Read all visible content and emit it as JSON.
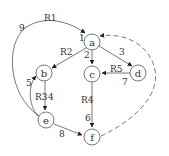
{
  "diagram": {
    "type": "directed-graph",
    "nodes": [
      {
        "id": "a",
        "label": "a",
        "x": 92,
        "y": 42
      },
      {
        "id": "b",
        "label": "b",
        "x": 44,
        "y": 73
      },
      {
        "id": "c",
        "label": "c",
        "x": 92,
        "y": 74
      },
      {
        "id": "d",
        "label": "d",
        "x": 138,
        "y": 73
      },
      {
        "id": "e",
        "label": "e",
        "x": 46,
        "y": 120
      },
      {
        "id": "f",
        "label": "f",
        "x": 92,
        "y": 137
      }
    ],
    "edges": [
      {
        "id": "e1",
        "from": "e",
        "to": "a",
        "num": "9",
        "name": "R1",
        "style": "solid"
      },
      {
        "id": "e2",
        "from": "a",
        "to": "b",
        "num": "1",
        "name": "R2",
        "style": "solid"
      },
      {
        "id": "e3",
        "from": "a",
        "to": "c",
        "num": "2",
        "name": "",
        "style": "solid"
      },
      {
        "id": "e4",
        "from": "a",
        "to": "d",
        "num": "3",
        "name": "",
        "style": "solid"
      },
      {
        "id": "e5",
        "from": "d",
        "to": "c",
        "num": "7",
        "name": "R5",
        "style": "solid"
      },
      {
        "id": "e6",
        "from": "b",
        "to": "e",
        "num": "4",
        "name": "R3",
        "style": "solid"
      },
      {
        "id": "e7",
        "from": "e",
        "to": "b",
        "num": "5",
        "name": "",
        "style": "solid"
      },
      {
        "id": "e8",
        "from": "c",
        "to": "f",
        "num": "6",
        "name": "R4",
        "style": "solid"
      },
      {
        "id": "e9",
        "from": "e",
        "to": "f",
        "num": "8",
        "name": "",
        "style": "solid"
      },
      {
        "id": "e10",
        "from": "f",
        "to": "a",
        "num": "",
        "name": "",
        "style": "dashed"
      }
    ],
    "labels": {
      "R1": "R1",
      "R2": "R2",
      "R3": "R3",
      "R4": "R4",
      "R5": "R5",
      "n1": "1",
      "n2": "2",
      "n3": "3",
      "n4": "4",
      "n5": "5",
      "n6": "6",
      "n7": "7",
      "n8": "8",
      "n9": "9"
    },
    "colors": {
      "stroke": "#555555",
      "text": "#333333",
      "background": "#ffffff"
    }
  }
}
